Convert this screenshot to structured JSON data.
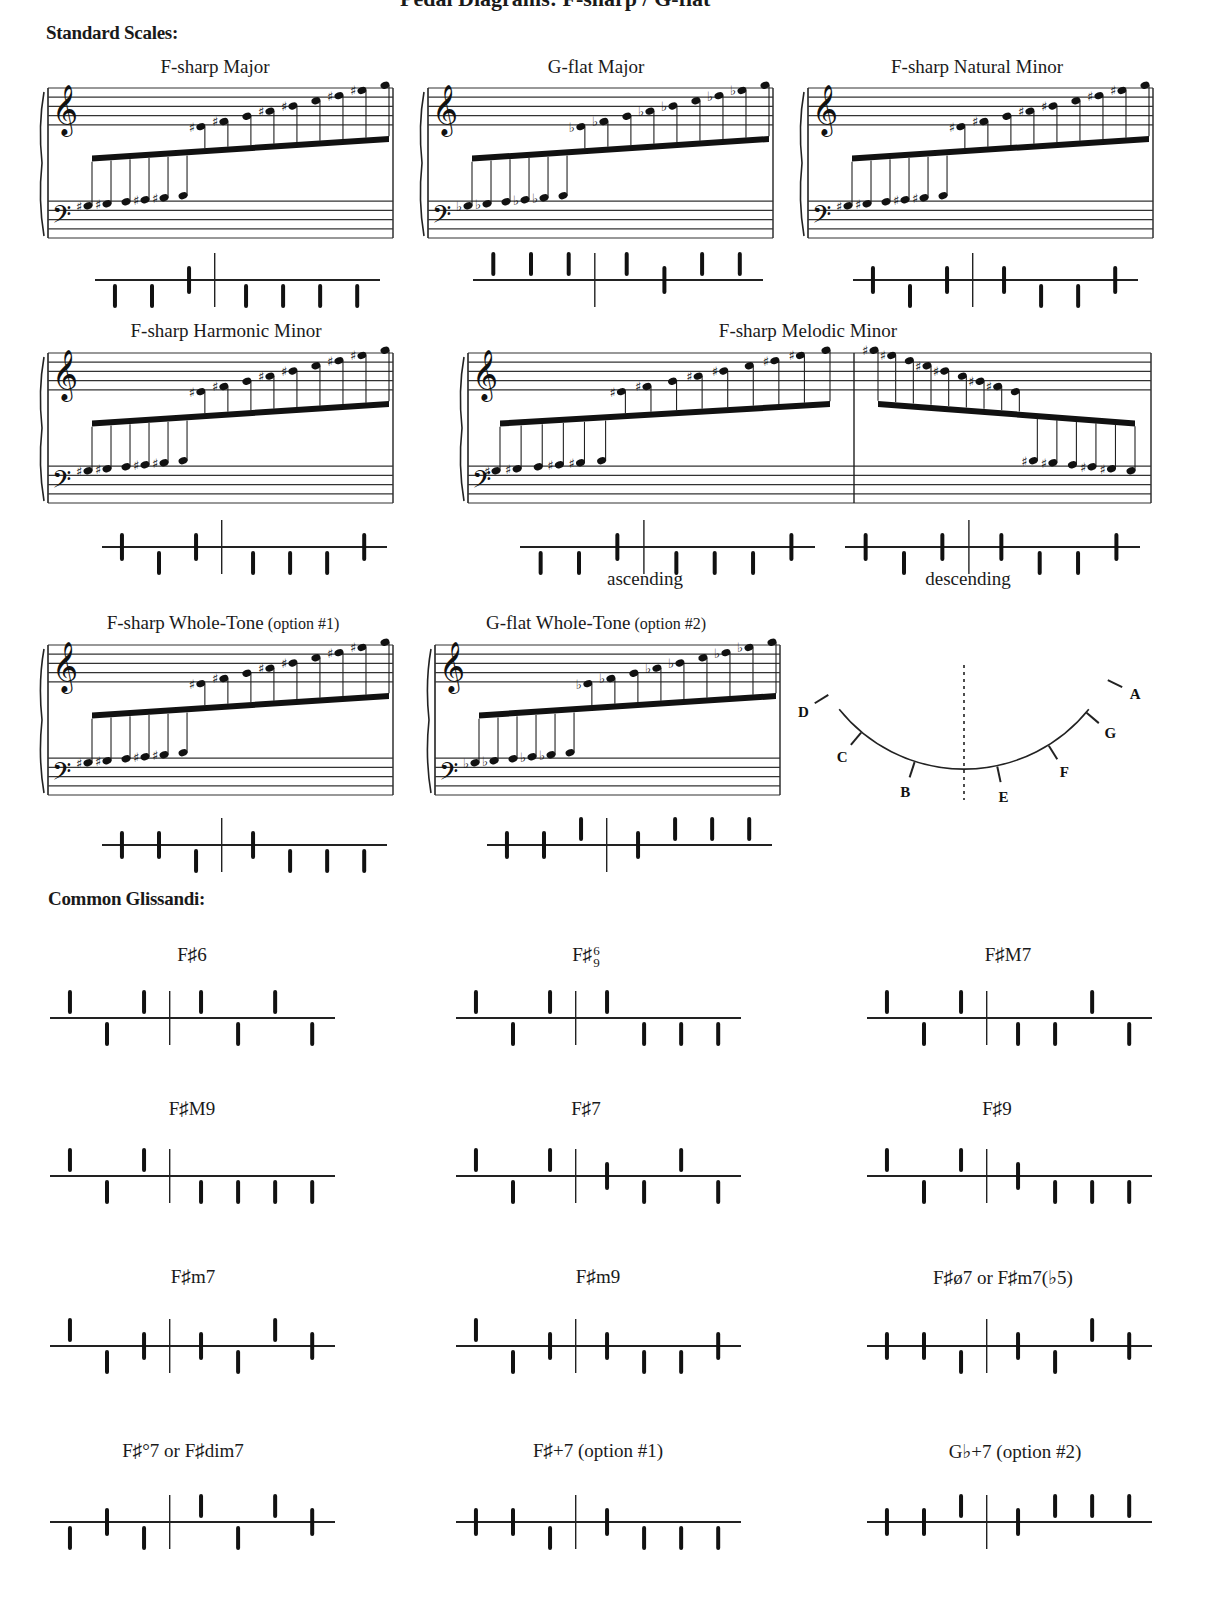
{
  "page": {
    "title_clipped": "Pedal Diagrams: F-sharp / G-flat",
    "sections": {
      "scales_heading": "Standard Scales:",
      "glissandi_heading": "Common Glissandi:"
    }
  },
  "pedal_legend": {
    "left_pedals": [
      "D",
      "C",
      "B"
    ],
    "right_pedals": [
      "E",
      "F",
      "G",
      "A"
    ],
    "positions": {
      "up": "flat",
      "mid": "natural",
      "down": "sharp"
    }
  },
  "scales": [
    {
      "id": "fsharp-major",
      "title": "F-sharp Major",
      "option": "",
      "x": 48,
      "y": 88,
      "w": 345,
      "label_x": 215,
      "label_y": 56,
      "accidental": "sharp",
      "diagram_y": 280,
      "diagram_x": 95,
      "diagram_w": 285,
      "pedals": [
        "down",
        "down",
        "mid",
        "down",
        "down",
        "down",
        "down"
      ]
    },
    {
      "id": "gflat-major",
      "title": "G-flat Major",
      "option": "",
      "x": 428,
      "y": 88,
      "w": 345,
      "label_x": 596,
      "label_y": 56,
      "accidental": "flat",
      "diagram_y": 280,
      "diagram_x": 473,
      "diagram_w": 290,
      "pedals": [
        "up",
        "up",
        "up",
        "up",
        "mid",
        "up",
        "up"
      ]
    },
    {
      "id": "fsharp-natural-minor",
      "title": "F-sharp Natural Minor",
      "option": "",
      "x": 808,
      "y": 88,
      "w": 345,
      "label_x": 977,
      "label_y": 56,
      "accidental": "sharp",
      "diagram_y": 280,
      "diagram_x": 853,
      "diagram_w": 285,
      "pedals": [
        "mid",
        "down",
        "mid",
        "mid",
        "down",
        "down",
        "mid"
      ]
    },
    {
      "id": "fsharp-harmonic-minor",
      "title": "F-sharp Harmonic Minor",
      "option": "",
      "x": 48,
      "y": 353,
      "w": 345,
      "label_x": 226,
      "label_y": 320,
      "accidental": "sharp",
      "diagram_y": 547,
      "diagram_x": 102,
      "diagram_w": 285,
      "pedals": [
        "mid",
        "down",
        "mid",
        "down",
        "down",
        "down",
        "mid"
      ]
    },
    {
      "id": "fsharp-whole-tone",
      "title": "F-sharp Whole-Tone",
      "option": "(option #1)",
      "x": 48,
      "y": 645,
      "w": 345,
      "label_x": 223,
      "label_y": 612,
      "accidental": "sharp",
      "diagram_y": 845,
      "diagram_x": 102,
      "diagram_w": 285,
      "pedals": [
        "mid",
        "mid",
        "down",
        "mid",
        "down",
        "down",
        "down"
      ]
    },
    {
      "id": "gflat-whole-tone",
      "title": "G-flat Whole-Tone",
      "option": "(option #2)",
      "x": 435,
      "y": 645,
      "w": 345,
      "label_x": 596,
      "label_y": 612,
      "accidental": "flat",
      "diagram_y": 845,
      "diagram_x": 487,
      "diagram_w": 285,
      "pedals": [
        "mid",
        "mid",
        "up",
        "mid",
        "up",
        "up",
        "up"
      ]
    }
  ],
  "melodic_minor": {
    "title": "F-sharp Melodic Minor",
    "x": 468,
    "y": 353,
    "w": 683,
    "label_x": 808,
    "label_y": 320,
    "ascending": {
      "label": "ascending",
      "pedals": [
        "down",
        "down",
        "mid",
        "down",
        "down",
        "down",
        "mid"
      ],
      "diagram_x": 520,
      "diagram_w": 295,
      "diagram_y": 547,
      "label_x": 645,
      "label_y": 568
    },
    "descending": {
      "label": "descending",
      "pedals": [
        "mid",
        "down",
        "mid",
        "mid",
        "down",
        "down",
        "mid"
      ],
      "diagram_x": 845,
      "diagram_w": 295,
      "diagram_y": 547,
      "label_x": 968,
      "label_y": 568
    }
  },
  "pedal_arc": {
    "x": 820,
    "y": 650,
    "labels": [
      "D",
      "C",
      "B",
      "E",
      "F",
      "G",
      "A"
    ]
  },
  "glissandi": [
    {
      "id": "f6",
      "label": "F♯6",
      "x": 192,
      "y": 944,
      "line_x": 50,
      "line_y": 1018,
      "w": 285,
      "pedals": [
        "up",
        "down",
        "up",
        "up",
        "down",
        "up",
        "down"
      ]
    },
    {
      "id": "f69",
      "label": "F♯",
      "sup": "6",
      "sub": "9",
      "x": 586,
      "y": 944,
      "line_x": 456,
      "line_y": 1018,
      "w": 285,
      "pedals": [
        "up",
        "down",
        "up",
        "up",
        "down",
        "down",
        "down"
      ]
    },
    {
      "id": "fM7",
      "label": "F♯M7",
      "x": 1008,
      "y": 944,
      "line_x": 867,
      "line_y": 1018,
      "w": 285,
      "pedals": [
        "up",
        "down",
        "up",
        "down",
        "down",
        "up",
        "down"
      ]
    },
    {
      "id": "fM9",
      "label": "F♯M9",
      "x": 192,
      "y": 1098,
      "line_x": 50,
      "line_y": 1176,
      "w": 285,
      "pedals": [
        "up",
        "down",
        "up",
        "down",
        "down",
        "down",
        "down"
      ]
    },
    {
      "id": "f7",
      "label": "F♯7",
      "x": 586,
      "y": 1098,
      "line_x": 456,
      "line_y": 1176,
      "w": 285,
      "pedals": [
        "up",
        "down",
        "up",
        "mid",
        "down",
        "up",
        "down"
      ]
    },
    {
      "id": "f9",
      "label": "F♯9",
      "x": 997,
      "y": 1098,
      "line_x": 867,
      "line_y": 1176,
      "w": 285,
      "pedals": [
        "up",
        "down",
        "up",
        "mid",
        "down",
        "down",
        "down"
      ]
    },
    {
      "id": "fm7",
      "label": "F♯m7",
      "x": 193,
      "y": 1266,
      "line_x": 50,
      "line_y": 1346,
      "w": 285,
      "pedals": [
        "up",
        "down",
        "mid",
        "mid",
        "down",
        "up",
        "mid"
      ]
    },
    {
      "id": "fm9",
      "label": "F♯m9",
      "x": 598,
      "y": 1266,
      "line_x": 456,
      "line_y": 1346,
      "w": 285,
      "pedals": [
        "up",
        "down",
        "mid",
        "mid",
        "down",
        "down",
        "mid"
      ]
    },
    {
      "id": "fhalfdim7",
      "label": "F♯ø7  or  F♯m7(♭5)",
      "x": 1003,
      "y": 1266,
      "line_x": 867,
      "line_y": 1346,
      "w": 285,
      "pedals": [
        "mid",
        "mid",
        "down",
        "mid",
        "down",
        "up",
        "mid"
      ]
    },
    {
      "id": "fdim7",
      "label": "F♯°7  or  F♯dim7",
      "x": 183,
      "y": 1440,
      "line_x": 50,
      "line_y": 1522,
      "w": 285,
      "pedals": [
        "down",
        "mid",
        "down",
        "up",
        "down",
        "up",
        "mid"
      ]
    },
    {
      "id": "faug7",
      "label": "F♯+7 (option #1)",
      "x": 598,
      "y": 1440,
      "line_x": 456,
      "line_y": 1522,
      "w": 285,
      "pedals": [
        "mid",
        "mid",
        "down",
        "mid",
        "down",
        "down",
        "down"
      ]
    },
    {
      "id": "gbaug7",
      "label": "G♭+7 (option #2)",
      "x": 1015,
      "y": 1440,
      "line_x": 867,
      "line_y": 1522,
      "w": 285,
      "pedals": [
        "mid",
        "mid",
        "up",
        "mid",
        "up",
        "up",
        "up"
      ]
    }
  ]
}
